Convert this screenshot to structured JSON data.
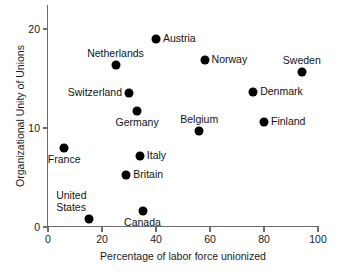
{
  "chart_data": {
    "type": "scatter",
    "title": "",
    "xlabel": "Percentage of labor force unionized",
    "ylabel": "Organizational Unity of Unions",
    "xlim": [
      0,
      100
    ],
    "ylim": [
      0,
      21
    ],
    "xticks": [
      0,
      20,
      40,
      60,
      80,
      100
    ],
    "yticks": [
      0,
      10,
      20
    ],
    "xticklabels": [
      "0",
      "20",
      "40",
      "60",
      "80",
      "100"
    ],
    "yticklabels": [
      "0",
      "10",
      "20"
    ],
    "grid": false,
    "legend": null,
    "marker_color": "#000000",
    "axis_color": "#6d6d6d",
    "points": [
      {
        "label": "Austria",
        "x": 40,
        "y": 19.0,
        "label_pos": "right"
      },
      {
        "label": "Norway",
        "x": 58,
        "y": 16.9,
        "label_pos": "right"
      },
      {
        "label": "Sweden",
        "x": 94,
        "y": 15.7,
        "label_pos": "above"
      },
      {
        "label": "Netherlands",
        "x": 25,
        "y": 16.4,
        "label_pos": "above"
      },
      {
        "label": "Switzerland",
        "x": 30,
        "y": 13.5,
        "label_pos": "left"
      },
      {
        "label": "Denmark",
        "x": 76,
        "y": 13.6,
        "label_pos": "right"
      },
      {
        "label": "Germany",
        "x": 33,
        "y": 11.7,
        "label_pos": "below"
      },
      {
        "label": "Finland",
        "x": 80,
        "y": 10.6,
        "label_pos": "right"
      },
      {
        "label": "Belgium",
        "x": 56,
        "y": 9.7,
        "label_pos": "above"
      },
      {
        "label": "France",
        "x": 6,
        "y": 8.0,
        "label_pos": "below"
      },
      {
        "label": "Italy",
        "x": 34,
        "y": 7.2,
        "label_pos": "right"
      },
      {
        "label": "Britain",
        "x": 29,
        "y": 5.3,
        "label_pos": "right"
      },
      {
        "label": "Canada",
        "x": 35,
        "y": 1.6,
        "label_pos": "below"
      },
      {
        "label": "United States",
        "x": 15,
        "y": 0.8,
        "label_pos": "upper-left"
      }
    ]
  }
}
